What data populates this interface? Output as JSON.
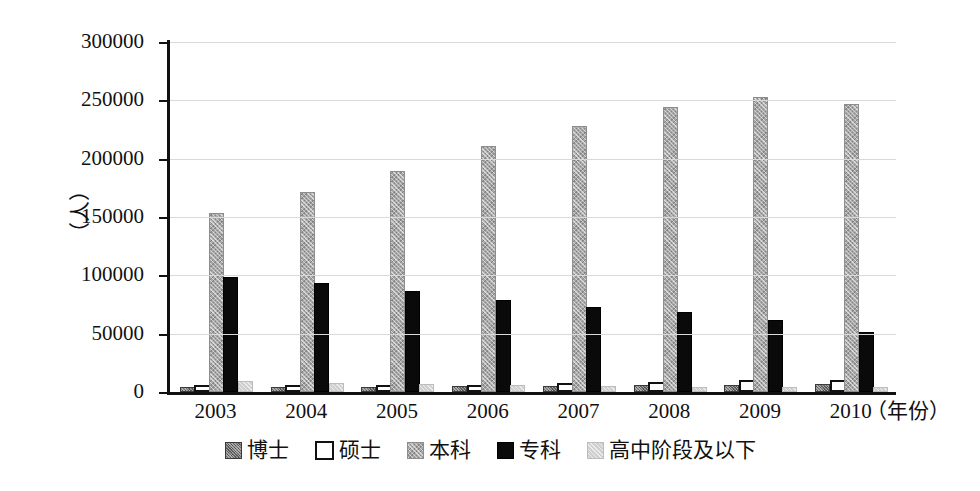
{
  "chart_data": {
    "type": "bar",
    "title": "",
    "subtitle": "",
    "xlabel": "（年份）",
    "ylabel": "（人）",
    "categories": [
      "2003",
      "2004",
      "2005",
      "2006",
      "2007",
      "2008",
      "2009",
      "2010"
    ],
    "ylim": [
      0,
      300000
    ],
    "ytick_values": [
      0,
      50000,
      100000,
      150000,
      200000,
      250000,
      300000
    ],
    "ytick_labels": [
      "0",
      "50000",
      "100000",
      "150000",
      "200000",
      "250000",
      "300000"
    ],
    "grid": true,
    "legend_position": "bottom",
    "series": [
      {
        "name": "博士",
        "color": "#6e6e6e",
        "swatch": "dark-gray-hatched",
        "values": [
          2200,
          2600,
          3000,
          3400,
          3800,
          4200,
          4600,
          5200
        ]
      },
      {
        "name": "硕士",
        "color": "#ffffff",
        "swatch": "white-outlined",
        "values": [
          1600,
          1900,
          2300,
          3000,
          4200,
          5400,
          6500,
          7200
        ]
      },
      {
        "name": "本科",
        "color": "#a8a8a8",
        "swatch": "medium-gray-hatched",
        "values": [
          152000,
          170000,
          188000,
          209000,
          226000,
          243000,
          251000,
          245000
        ]
      },
      {
        "name": "专科",
        "color": "#0a0a0a",
        "swatch": "solid-black",
        "values": [
          97000,
          92000,
          85000,
          77000,
          71000,
          67000,
          60000,
          50000
        ]
      },
      {
        "name": "高中阶段及以下",
        "color": "#cfcfcf",
        "swatch": "light-gray",
        "values": [
          7500,
          6200,
          5000,
          4200,
          3600,
          2200,
          1800,
          1500
        ]
      }
    ]
  }
}
